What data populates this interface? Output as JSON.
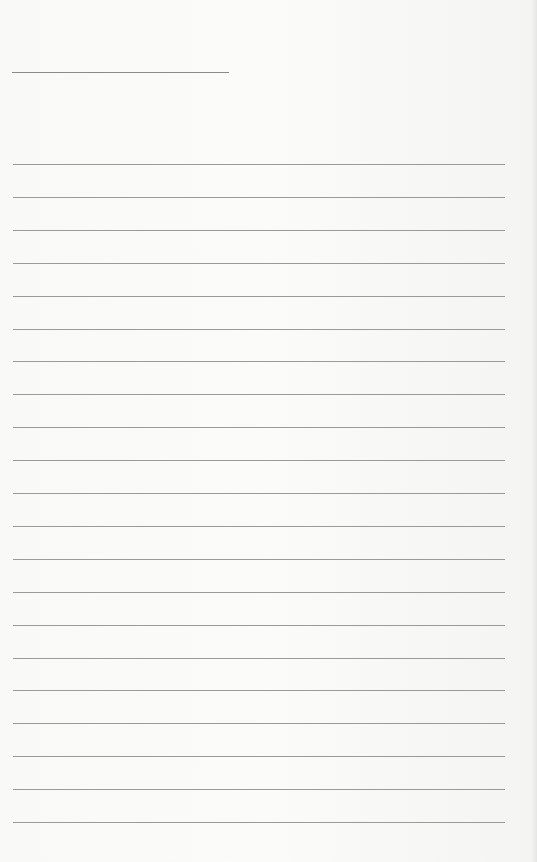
{
  "page": {
    "type": "lined-paper",
    "background_color": "#f8f8f7",
    "line_color": "#9a9a9a",
    "header_line": {
      "x": 12,
      "y": 72,
      "width": 217
    },
    "rules": {
      "count": 21,
      "start_y": 164,
      "spacing": 32.9,
      "x": 13,
      "width": 492
    }
  }
}
